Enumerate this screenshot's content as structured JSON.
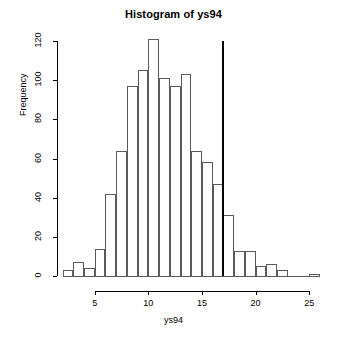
{
  "chart_data": {
    "type": "bar",
    "title": "Histogram of ys94",
    "subtitle": "",
    "xlabel": "ys94",
    "ylabel": "Frequency",
    "xlim": [
      2,
      26
    ],
    "ylim": [
      0,
      120
    ],
    "grid": false,
    "legend": null,
    "bin_width": 1,
    "bin_starts": [
      2,
      3,
      4,
      5,
      6,
      7,
      8,
      9,
      10,
      11,
      12,
      13,
      14,
      15,
      16,
      17,
      18,
      19,
      20,
      21,
      22,
      25
    ],
    "categories": [
      "2-3",
      "3-4",
      "4-5",
      "5-6",
      "6-7",
      "7-8",
      "8-9",
      "9-10",
      "10-11",
      "11-12",
      "12-13",
      "13-14",
      "14-15",
      "15-16",
      "16-17",
      "17-18",
      "18-19",
      "19-20",
      "20-21",
      "21-22",
      "22-23",
      "25-26"
    ],
    "values": [
      3,
      7,
      4,
      14,
      42,
      64,
      97,
      105,
      121,
      101,
      97,
      103,
      64,
      58,
      47,
      31,
      13,
      13,
      5,
      6,
      3,
      1
    ],
    "x_ticks": [
      5,
      10,
      15,
      20,
      25
    ],
    "x_tick_labels": [
      "5",
      "10",
      "15",
      "20",
      "25"
    ],
    "y_ticks": [
      0,
      20,
      40,
      60,
      80,
      100,
      120
    ],
    "y_tick_labels": [
      "0",
      "20",
      "40",
      "60",
      "80",
      "100",
      "120"
    ],
    "annotations": [
      {
        "name": "vertical-reference-line",
        "type": "vline",
        "x": 17,
        "y_top": 120,
        "color": "#000000"
      }
    ],
    "bar_edge_color": "#5a5a5a",
    "bar_fill_color": "transparent"
  }
}
